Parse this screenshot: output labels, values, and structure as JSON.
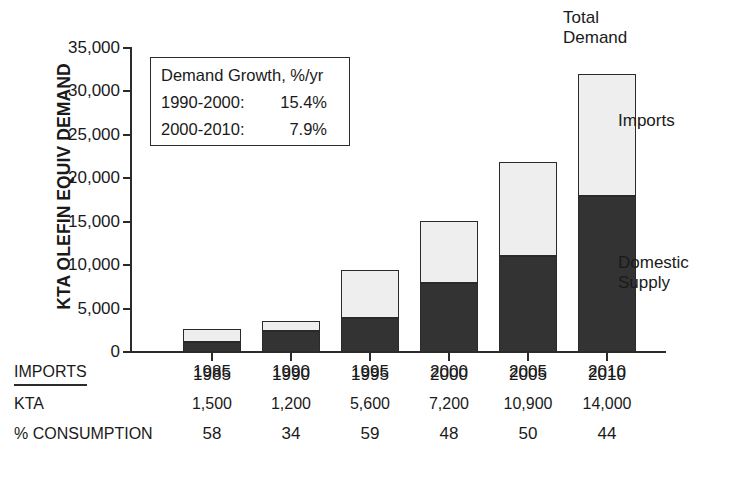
{
  "chart_data": {
    "type": "bar",
    "subtype": "stacked-bar",
    "title": "",
    "xlabel": "",
    "ylabel": "KTA OLEFIN EQUIV DEMAND",
    "categories": [
      "1985",
      "1990",
      "1995",
      "2000",
      "2005",
      "2010"
    ],
    "series": [
      {
        "name": "Domestic Supply",
        "values": [
          1100,
          2400,
          3900,
          7900,
          11000,
          18000
        ],
        "color": "#333333"
      },
      {
        "name": "Imports",
        "values": [
          1500,
          1200,
          5600,
          7200,
          10900,
          14000
        ],
        "color": "#eeeeee"
      }
    ],
    "totals": [
      2600,
      3600,
      9500,
      15100,
      21900,
      32000
    ],
    "ylim": [
      0,
      35000
    ],
    "yticks": [
      0,
      5000,
      10000,
      15000,
      20000,
      25000,
      30000,
      35000
    ],
    "ytick_labels": [
      "0",
      "5,000",
      "10,000",
      "15,000",
      "20,000",
      "25,000",
      "30,000",
      "35,000"
    ],
    "grid": false,
    "legend_position": "right-inline",
    "annotations": [
      {
        "name": "total-demand",
        "text": "Total\nDemand"
      },
      {
        "name": "imports",
        "text": "Imports"
      },
      {
        "name": "domestic-supply",
        "text": "Domestic\nSupply"
      }
    ]
  },
  "y_axis": {
    "title": "KTA OLEFIN EQUIV DEMAND",
    "ticks": [
      {
        "value": 35000,
        "label": "35,000"
      },
      {
        "value": 30000,
        "label": "30,000"
      },
      {
        "value": 25000,
        "label": "25,000"
      },
      {
        "value": 20000,
        "label": "20,000"
      },
      {
        "value": 15000,
        "label": "15,000"
      },
      {
        "value": 10000,
        "label": "10,000"
      },
      {
        "value": 5000,
        "label": "5,000"
      },
      {
        "value": 0,
        "label": "0"
      }
    ]
  },
  "x_axis": {
    "ticks": [
      "1985",
      "1990",
      "1995",
      "2000",
      "2005",
      "2010"
    ]
  },
  "growth_box": {
    "title": "Demand Growth, %/yr",
    "rows": [
      {
        "range": "1990-2000:",
        "value": "15.4%"
      },
      {
        "range": "2000-2010:",
        "value": "7.9%"
      }
    ]
  },
  "callouts": {
    "total_demand_line1": "Total",
    "total_demand_line2": "Demand",
    "imports": "Imports",
    "domestic_line1": "Domestic",
    "domestic_line2": "Supply"
  },
  "table": {
    "header_label": "IMPORTS",
    "years": [
      "1985",
      "1990",
      "1995",
      "2000",
      "2005",
      "2010"
    ],
    "rows": [
      {
        "label": "KTA",
        "values": [
          "1,500",
          "1,200",
          "5,600",
          "7,200",
          "10,900",
          "14,000"
        ]
      },
      {
        "label": "% CONSUMPTION",
        "values": [
          "58",
          "34",
          "59",
          "48",
          "50",
          "44"
        ]
      }
    ]
  },
  "colors": {
    "domestic_supply": "#333333",
    "imports": "#eeeeee",
    "axis": "#2b2b2b",
    "text": "#1a1a1a",
    "background": "#ffffff"
  }
}
